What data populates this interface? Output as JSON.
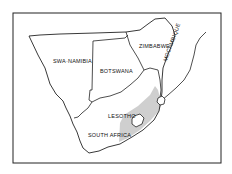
{
  "map": {
    "title": "",
    "labels": {
      "namibia": "SWA·NAMIBIA",
      "botswana": "BOTSWANA",
      "zimbabwe": "ZIMBABWE",
      "mozambique": "MOCAMBIQUE",
      "lesotho": "LESOTHO",
      "south_africa": "SOUTH AFRICA"
    },
    "colors": {
      "border": "#222222",
      "shaded_region": "#d0d0d0",
      "background": "#ffffff"
    },
    "legend": []
  }
}
